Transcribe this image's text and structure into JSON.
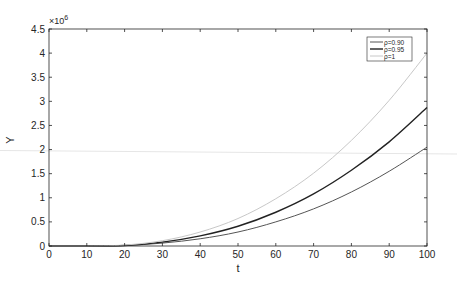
{
  "chart_data": {
    "type": "line",
    "title": "",
    "xlabel": "t",
    "ylabel": "Y",
    "y_exponent_label": "×10",
    "y_exponent_power": "6",
    "xlim": [
      0,
      100
    ],
    "ylim": [
      0,
      4.5
    ],
    "x_ticks": [
      "0",
      "10",
      "20",
      "30",
      "40",
      "50",
      "60",
      "70",
      "80",
      "90",
      "100"
    ],
    "y_ticks": [
      "0",
      "0.5",
      "1",
      "1.5",
      "2",
      "2.5",
      "3",
      "3.5",
      "4",
      "4.5"
    ],
    "grid": false,
    "legend_position": "upper right",
    "x": [
      10,
      20,
      30,
      40,
      50,
      60,
      70,
      80,
      90,
      100
    ],
    "series": [
      {
        "name": "ρ=0.90",
        "color": "#555555",
        "values": [
          0,
          0.01,
          0.06,
          0.15,
          0.29,
          0.5,
          0.77,
          1.12,
          1.55,
          2.05
        ]
      },
      {
        "name": "ρ=0.95",
        "color": "#222222",
        "values": [
          0,
          0.01,
          0.08,
          0.21,
          0.41,
          0.7,
          1.08,
          1.57,
          2.16,
          2.87
        ]
      },
      {
        "name": "ρ=1",
        "color": "#c8c8c8",
        "values": [
          0,
          0.02,
          0.11,
          0.29,
          0.57,
          0.98,
          1.51,
          2.19,
          3.02,
          4.0
        ]
      }
    ],
    "units_note": "Y values in units of 10^6"
  }
}
